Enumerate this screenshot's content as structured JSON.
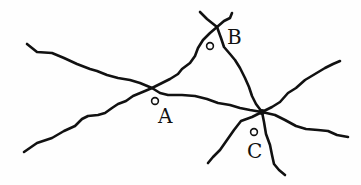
{
  "diagram": {
    "type": "road-network",
    "stroke_color": "#111111",
    "background": "#ffffff",
    "points": [
      {
        "id": "A",
        "label": "A",
        "marker": [
          155,
          101
        ],
        "label_pos": [
          158,
          108
        ]
      },
      {
        "id": "B",
        "label": "B",
        "marker": [
          210,
          46
        ],
        "label_pos": [
          226,
          28
        ]
      },
      {
        "id": "C",
        "label": "C",
        "marker": [
          254,
          132
        ],
        "label_pos": [
          247,
          142
        ]
      }
    ],
    "junctions": [
      {
        "name": "junction-A",
        "at": [
          152,
          88
        ]
      },
      {
        "name": "junction-B",
        "at": [
          217,
          27
        ]
      },
      {
        "name": "junction-C",
        "at": [
          262,
          112
        ]
      }
    ]
  }
}
